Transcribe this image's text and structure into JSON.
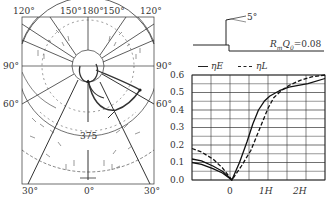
{
  "polar_plot": {
    "top_labels": [
      "120°",
      "150°",
      "180°",
      "150°",
      "120°"
    ],
    "left_labels": [
      "90°",
      "60°"
    ],
    "right_labels": [
      "90°",
      "60°"
    ],
    "bottom_labels": [
      "30°",
      "0°",
      "30°"
    ],
    "center_value": "375"
  },
  "profile": {
    "angle_label": "5°",
    "parameter_label": "R_m Q_0=0.08",
    "param_main": "R",
    "param_sub1": "m",
    "param_mid": "Q",
    "param_sub2": "0",
    "param_value": "=0.08"
  },
  "legend": {
    "items": [
      {
        "label": "ηE",
        "style": "solid"
      },
      {
        "label": "ηL",
        "style": "dashed"
      }
    ]
  },
  "chart_data": {
    "type": "line",
    "title": "",
    "xlabel": "",
    "ylabel": "",
    "x_tick_labels": [
      "0",
      "1H",
      "2H"
    ],
    "y_tick_labels": [
      "0.0",
      "0.1",
      "0.2",
      "0.3",
      "0.4",
      "0.5",
      "0.6"
    ],
    "ylim": [
      0.0,
      0.6
    ],
    "xlim": [
      -1.05,
      1.35
    ],
    "grid": true,
    "legend_position": "top",
    "x": [
      -1.05,
      -0.8,
      -0.5,
      -0.25,
      0.0,
      0.25,
      0.5,
      0.75,
      1.0,
      1.25,
      1.5,
      1.75,
      2.0,
      2.25,
      2.45
    ],
    "series": [
      {
        "name": "ηE",
        "style": "solid",
        "x": [
          -1.05,
          -0.8,
          -0.5,
          -0.25,
          0.0,
          0.2,
          0.4,
          0.55,
          0.7,
          0.85,
          1.0,
          1.25,
          1.5,
          2.0,
          2.45
        ],
        "values": [
          0.12,
          0.11,
          0.08,
          0.05,
          0.0,
          0.1,
          0.22,
          0.32,
          0.4,
          0.45,
          0.48,
          0.51,
          0.53,
          0.55,
          0.58
        ]
      },
      {
        "name": "ηE (lower)",
        "style": "solid",
        "x": [
          -1.05,
          -0.8,
          -0.5,
          -0.25,
          0.0
        ],
        "values": [
          0.1,
          0.09,
          0.065,
          0.04,
          0.0
        ]
      },
      {
        "name": "ηL",
        "style": "dashed",
        "x": [
          -1.05,
          -0.8,
          -0.5,
          -0.25,
          0.0,
          0.25,
          0.5,
          0.65,
          0.8,
          0.95,
          1.1,
          1.3,
          1.5,
          1.8,
          2.1,
          2.45
        ],
        "values": [
          0.18,
          0.16,
          0.12,
          0.07,
          0.0,
          0.08,
          0.17,
          0.25,
          0.33,
          0.41,
          0.47,
          0.51,
          0.54,
          0.57,
          0.59,
          0.6
        ]
      }
    ]
  }
}
